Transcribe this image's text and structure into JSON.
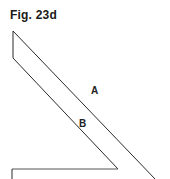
{
  "figure": {
    "title": "Fig. 23d",
    "labels": [
      {
        "id": "A",
        "text": "A"
      },
      {
        "id": "B",
        "text": "B"
      }
    ],
    "stroke_color": "#2a2a2a"
  }
}
